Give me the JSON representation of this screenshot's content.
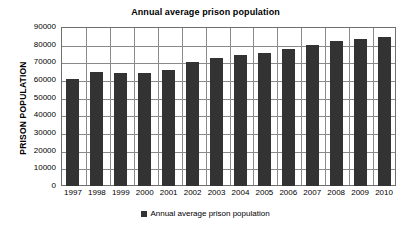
{
  "chart_data": {
    "type": "bar",
    "title": "Annual average prison population",
    "xlabel": "",
    "ylabel": "PRISON POPULATION",
    "categories": [
      "1997",
      "1998",
      "1999",
      "2000",
      "2001",
      "2002",
      "2003",
      "2004",
      "2005",
      "2006",
      "2007",
      "2008",
      "2009",
      "2010"
    ],
    "values": [
      60500,
      64500,
      63900,
      63800,
      65500,
      70100,
      72500,
      74200,
      75200,
      77600,
      79700,
      82000,
      83200,
      84500
    ],
    "series": [
      {
        "name": "Annual average prison population",
        "values": [
          60500,
          64500,
          63900,
          63800,
          65500,
          70100,
          72500,
          74200,
          75200,
          77600,
          79700,
          82000,
          83200,
          84500
        ]
      }
    ],
    "ylim": [
      0,
      90000
    ],
    "ytick_step": 10000,
    "yticks": [
      "90000",
      "80000",
      "70000",
      "60000",
      "50000",
      "40000",
      "30000",
      "20000",
      "10000",
      "0"
    ],
    "ytick_values": [
      90000,
      80000,
      70000,
      60000,
      50000,
      40000,
      30000,
      20000,
      10000,
      0
    ],
    "grid": "both",
    "legend_position": "bottom",
    "legend_entries": [
      "Annual average prison population"
    ],
    "bar_color": "#333333",
    "grid_color": "#8a8a8a",
    "plot_border_color": "#6f6f6f",
    "background_color": "#ffffff"
  }
}
